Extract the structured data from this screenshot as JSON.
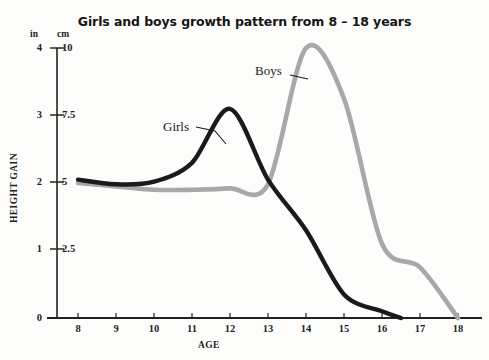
{
  "chart_data": {
    "type": "line",
    "title": "Girls and boys growth pattern from 8 – 18 years",
    "xlabel": "AGE",
    "ylabel": "HEIGHT GAIN",
    "grid": false,
    "legend_position": "inline-annotation",
    "x": [
      8,
      9,
      10,
      11,
      12,
      13,
      14,
      15,
      16,
      17,
      18
    ],
    "xlim": [
      8,
      18
    ],
    "axes": {
      "left": {
        "unit": "in",
        "ticks": [
          "4",
          "3",
          "2",
          "1",
          "0"
        ],
        "tick_values": [
          4,
          3,
          2,
          1,
          0
        ],
        "range": [
          0,
          4
        ]
      },
      "right_of_left": {
        "unit": "cm",
        "ticks": [
          "10",
          "7.5",
          "5",
          "2.5",
          "0"
        ],
        "tick_values": [
          10,
          7.5,
          5,
          2.5,
          0
        ],
        "range": [
          0,
          10
        ]
      }
    },
    "xtick_labels": [
      "8",
      "9",
      "10",
      "11",
      "12",
      "13",
      "14",
      "15",
      "16",
      "17",
      "18"
    ],
    "series": [
      {
        "name": "Girls",
        "color": "#1a1a1a",
        "unit": "in",
        "values": [
          2.05,
          1.98,
          2.02,
          2.3,
          3.1,
          2.05,
          1.3,
          0.35,
          0.1,
          null,
          null
        ],
        "values_cm": [
          5.1,
          4.95,
          5.05,
          5.75,
          7.85,
          5.15,
          3.25,
          0.88,
          0.25,
          null,
          null
        ],
        "ends_at_age": 16.5
      },
      {
        "name": "Boys",
        "color": "#a8a8a8",
        "unit": "in",
        "values": [
          2.0,
          1.95,
          1.9,
          1.9,
          1.92,
          1.98,
          4.0,
          3.25,
          1.1,
          0.75,
          0.0
        ],
        "values_cm": [
          5.0,
          4.88,
          4.75,
          4.75,
          4.8,
          4.95,
          10.0,
          8.12,
          2.75,
          1.88,
          0.0
        ],
        "ends_at_age": 18
      }
    ],
    "annotations": [
      {
        "text": "Girls",
        "series": "Girls",
        "points_to_age": 12
      },
      {
        "text": "Boys",
        "series": "Boys",
        "points_to_age": 13.6
      }
    ]
  },
  "colors": {
    "girls_line": "#1a1a1a",
    "boys_line": "#a8a8a8",
    "axis": "#232323",
    "background": "#fdfdfc",
    "text": "#1d1d1d"
  }
}
